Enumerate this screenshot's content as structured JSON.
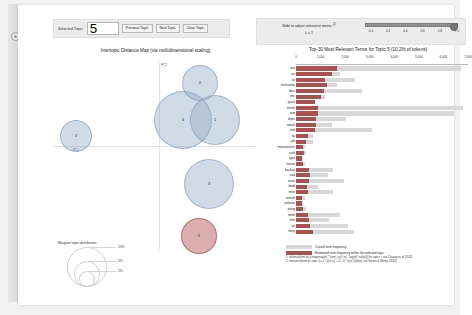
{
  "app": {
    "title": "pyLDAvis topic model visualization"
  },
  "controls": {
    "selected_topic_label": "Selected Topic:",
    "selected_topic_value": "5",
    "previous_topic_label": "Previous Topic",
    "next_topic_label": "Next Topic",
    "clear_topic_label": "Clear Topic",
    "lambda_title": "Slide to adjust relevance metric:",
    "lambda_superscript": "(2)",
    "lambda_value_label": "λ = 1",
    "slider_ticks": [
      "0.0",
      "0.2",
      "0.4",
      "0.6",
      "0.8",
      "1.0"
    ],
    "slider_position_pct": 100
  },
  "left_panel": {
    "title": "Intertopic Distance Map (via multidimensional scaling)",
    "x_axis_label": "PC1",
    "y_axis_label": "PC2",
    "marginal_legend_title": "Marginal topic distribution",
    "marginal_sizes": [
      "2%",
      "5%",
      "10%"
    ]
  },
  "topics": [
    {
      "id": "3",
      "x": 24,
      "y": 78,
      "r": 15,
      "selected": false
    },
    {
      "id": "2",
      "x": 148,
      "y": 25,
      "r": 17,
      "selected": false
    },
    {
      "id": "4",
      "x": 131,
      "y": 62,
      "r": 28,
      "selected": false
    },
    {
      "id": "1",
      "x": 163,
      "y": 62,
      "r": 24,
      "selected": false
    },
    {
      "id": "3",
      "x": 157,
      "y": 126,
      "r": 24,
      "selected": false
    },
    {
      "id": "5",
      "x": 147,
      "y": 178,
      "r": 17,
      "selected": true
    }
  ],
  "right_panel": {
    "title": "Top-30 Most Relevant Terms for Topic 5 (10.2% of tokens)",
    "legend_overall": "Overall term frequency",
    "legend_estimated": "Estimated term frequency within the selected topic",
    "footnote_1": "1. saliency(term w) = frequency(w) * [sum_t p(t | w) * log(p(t | w)/p(t))] for topics t; see Chuang et. al (2012)",
    "footnote_2": "2. relevance(term w | topic t) = λ * p(w | t) + (1 - λ) * p(w | t)/p(w); see Sievert & Shirley (2014)"
  },
  "chart_data": {
    "type": "bar",
    "title": "Top-30 Most Relevant Terms for Topic 5 (10.2% of tokens)",
    "xlabel": "",
    "ylabel": "",
    "xlim": [
      0,
      7000
    ],
    "xticks": [
      0,
      1000,
      2000,
      3000,
      4000,
      5000,
      6000,
      7000
    ],
    "xticklabels": [
      "0",
      "1,000",
      "2,000",
      "3,000",
      "4,000",
      "5,000",
      "6,000",
      "7,000"
    ],
    "grid": false,
    "legend_position": "bottom",
    "categories": [
      "use",
      "car",
      "lot",
      "instruction",
      "duct",
      "imc",
      "quick",
      "brush",
      "arm",
      "dryer",
      "watch",
      "end",
      "tip",
      "job",
      "manufacture",
      "craft",
      "type",
      "house",
      "backup",
      "sad",
      "torso",
      "modi",
      "miss",
      "overall",
      "unknow",
      "string",
      "mom",
      "shot",
      "art",
      "thing"
    ],
    "series": [
      {
        "name": "Overall term frequency",
        "values": [
          6700,
          1800,
          2400,
          1650,
          2700,
          1200,
          300,
          6800,
          6450,
          2050,
          1450,
          3100,
          700,
          700,
          350,
          400,
          300,
          350,
          1500,
          1300,
          1950,
          900,
          1500,
          350,
          300,
          420,
          1800,
          1350,
          2100,
          2350
        ]
      },
      {
        "name": "Estimated term frequency within the selected topic",
        "values": [
          1650,
          1450,
          1200,
          1250,
          1150,
          1000,
          780,
          900,
          880,
          830,
          800,
          760,
          480,
          420,
          300,
          320,
          260,
          300,
          540,
          560,
          540,
          430,
          480,
          260,
          230,
          300,
          480,
          520,
          560,
          700
        ]
      }
    ]
  }
}
